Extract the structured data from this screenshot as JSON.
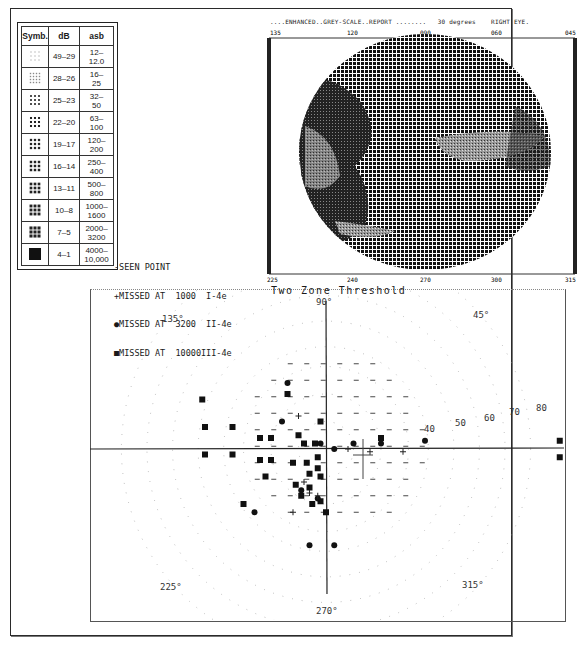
{
  "legend_table": {
    "headers": [
      "Symb.",
      "dB",
      "asb"
    ],
    "rows": [
      {
        "symbol": "sparse-dots",
        "db": "49–29",
        "asb": "12–\n12.0"
      },
      {
        "symbol": "fine-dots",
        "db": "28–26",
        "asb": "16–\n25"
      },
      {
        "symbol": "small-grid",
        "db": "25–23",
        "asb": "32–\n50"
      },
      {
        "symbol": "medium-grid",
        "db": "22–20",
        "asb": "63–\n100"
      },
      {
        "symbol": "dense-squares",
        "db": "19–17",
        "asb": "120–\n200"
      },
      {
        "symbol": "denser-squares",
        "db": "16–14",
        "asb": "250–\n400"
      },
      {
        "symbol": "heavy-squares",
        "db": "13–11",
        "asb": "500–\n800"
      },
      {
        "symbol": "solid-squares",
        "db": "10–8",
        "asb": "1000–\n1600"
      },
      {
        "symbol": "crosshatch-block",
        "db": "7–5",
        "asb": "2000–\n3200"
      },
      {
        "symbol": "black-block",
        "db": "4–1",
        "asb": "4000–\n10,000"
      }
    ]
  },
  "grey_report": {
    "title": "....ENHANCED..GREY-SCALE..REPORT ........   30 degrees    RIGHT EYE.",
    "top_axis": [
      "135",
      "120",
      "090",
      "060",
      "045"
    ],
    "bottom_axis": [
      "225",
      "240",
      "270",
      "300",
      "315"
    ]
  },
  "symbol_legend": {
    "lines": [
      "-SEEN POINT",
      "+MISSED AT  1000  I-4e",
      "●MISSED AT  3200  II-4e",
      "■MISSED AT  10000III-4e"
    ]
  },
  "chart_data": [
    {
      "type": "heatmap",
      "title": "ENHANCED GREY-SCALE REPORT",
      "subtitle": "30 degrees RIGHT EYE",
      "top_axis_ticks": [
        "135",
        "120",
        "090",
        "060",
        "045"
      ],
      "bottom_axis_ticks": [
        "225",
        "240",
        "270",
        "300",
        "315"
      ],
      "description": "Circular grey-scale visual field; dark/dense region on left (temporal) side and a horizontal light band right of center (blind spot area), light band lower-left."
    },
    {
      "type": "scatter",
      "title": "Two Zone Threshold",
      "angle_labels": [
        "90°",
        "45°",
        "135°",
        "225°",
        "270°",
        "315°"
      ],
      "ring_labels": [
        "40",
        "50",
        "60",
        "70",
        "80"
      ],
      "legend": [
        "- SEEN POINT",
        "+ MISSED AT 1000 I-4e",
        "● MISSED AT 3200 II-4e",
        "■ MISSED AT 10000 III-4e"
      ],
      "coord_system": "x,y in degrees from fixation (right = 0°, up = 90°)",
      "missed_10000_squares": [
        [
          -45,
          18
        ],
        [
          -44,
          8
        ],
        [
          -44,
          -2
        ],
        [
          -34,
          8
        ],
        [
          -34,
          -2
        ],
        [
          -24,
          4
        ],
        [
          -24,
          -4
        ],
        [
          -20,
          4
        ],
        [
          -20,
          -4
        ],
        [
          -10,
          5
        ],
        [
          -12,
          -5
        ],
        [
          -8,
          2
        ],
        [
          -7,
          -5
        ],
        [
          -6,
          -9
        ],
        [
          -3,
          -7
        ],
        [
          -4,
          2
        ],
        [
          -3,
          -3
        ],
        [
          -2,
          -10
        ],
        [
          -6,
          -14
        ],
        [
          -2,
          10
        ],
        [
          -22,
          -10
        ],
        [
          -11,
          -13
        ],
        [
          -9,
          -17
        ],
        [
          -5,
          -20
        ],
        [
          -2,
          -19
        ],
        [
          -30,
          -20
        ],
        [
          0,
          -23
        ],
        [
          -14,
          20
        ],
        [
          20,
          4
        ],
        [
          85,
          3
        ],
        [
          85,
          -3
        ]
      ],
      "missed_3200_circles": [
        [
          -14,
          24
        ],
        [
          -16,
          10
        ],
        [
          -2,
          2
        ],
        [
          3,
          0
        ],
        [
          10,
          2
        ],
        [
          20,
          2
        ],
        [
          -9,
          -15
        ],
        [
          -3,
          -18
        ],
        [
          -26,
          -23
        ],
        [
          -6,
          -35
        ],
        [
          3,
          -35
        ],
        [
          36,
          3
        ]
      ],
      "missed_1000_plus": [
        [
          -10,
          12
        ],
        [
          8,
          0
        ],
        [
          16,
          -1
        ],
        [
          28,
          -1
        ],
        [
          -8,
          -12
        ],
        [
          -6,
          -16
        ],
        [
          -3,
          -17
        ],
        [
          -12,
          -23
        ]
      ]
    }
  ],
  "polar_chart": {
    "title": "Two Zone Threshold",
    "label_90": "90°",
    "label_45": "45°",
    "label_135": "135°",
    "label_225": "225°",
    "label_270": "270°",
    "label_315": "315°",
    "ring_40": "40",
    "ring_50": "50",
    "ring_60": "60",
    "ring_70": "70",
    "ring_80": "80"
  }
}
